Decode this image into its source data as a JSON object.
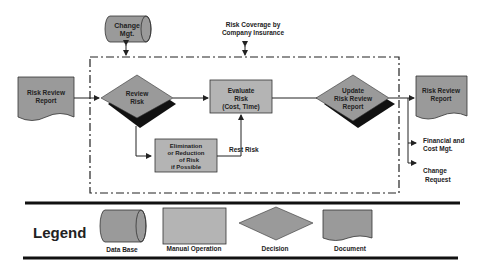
{
  "diagram": {
    "colors": {
      "shape_fill": "#9a9a9a",
      "box_fill": "#b4b4b4",
      "shadow": "#111111",
      "line": "#222222",
      "background": "#ffffff"
    },
    "nodes": {
      "change_mgt": {
        "type": "database",
        "line1": "Change",
        "line2": "Mgt."
      },
      "risk_coverage": {
        "type": "label",
        "line1": "Risk Coverage by",
        "line2": "Company Insurance"
      },
      "input_report": {
        "type": "document",
        "line1": "Risk Review",
        "line2": "Report"
      },
      "review_risk": {
        "type": "decision",
        "line1": "Review",
        "line2": "Risk"
      },
      "evaluate_risk": {
        "type": "manual_operation",
        "line1": "Evaluate",
        "line2": "Risk",
        "line3": "(Cost, Time)"
      },
      "elimination": {
        "type": "manual_operation",
        "line1": "Elimination",
        "line2": "or Reduction",
        "line3": "of Risk",
        "line4": "if Possible"
      },
      "update_report": {
        "type": "decision",
        "line1": "Update",
        "line2": "Risk Review",
        "line3": "Report"
      },
      "output_report": {
        "type": "document",
        "line1": "Risk Review",
        "line2": "Report"
      },
      "financial": {
        "type": "label",
        "line1": "Financial and",
        "line2": "Cost Mgt."
      },
      "change_request": {
        "type": "label",
        "line1": "Change",
        "line2": "Request"
      }
    },
    "edges": {
      "rest_risk_label": "Rest Risk"
    }
  },
  "legend": {
    "title": "Legend",
    "items": [
      {
        "shape": "database",
        "label": "Data Base"
      },
      {
        "shape": "manual_operation",
        "label": "Manual Operation"
      },
      {
        "shape": "decision",
        "label": "Decision"
      },
      {
        "shape": "document",
        "label": "Document"
      }
    ]
  }
}
